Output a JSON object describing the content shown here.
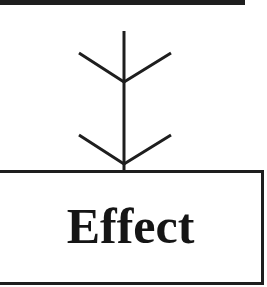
{
  "diagram": {
    "top_box": {
      "label": ""
    },
    "connector": {
      "type": "arrow-down-with-feathers",
      "color": "#1e1e1e"
    },
    "bottom_box": {
      "label": "Effect"
    }
  }
}
